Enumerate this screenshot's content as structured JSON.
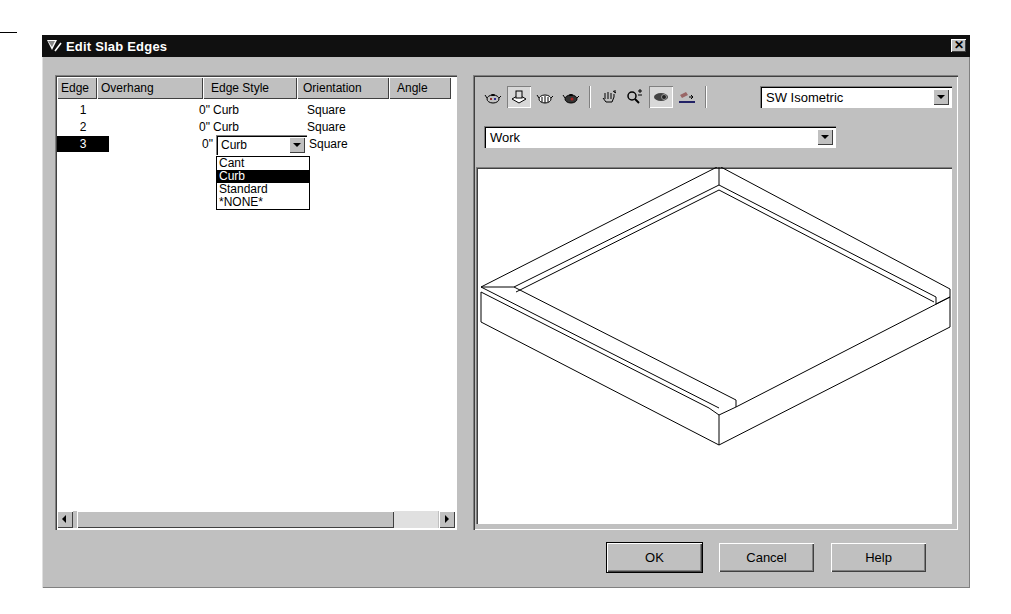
{
  "dialog": {
    "title": "Edit Slab Edges",
    "close_label": "✕"
  },
  "table": {
    "columns": [
      {
        "label": "Edge",
        "width": 40
      },
      {
        "label": "Overhang",
        "width": 106
      },
      {
        "label": "Edge Style",
        "width": 94
      },
      {
        "label": "Orientation",
        "width": 92
      },
      {
        "label": "Angle",
        "width": 62
      }
    ],
    "rows": [
      {
        "edge": "1",
        "overhang": "0\"",
        "edge_style": "Curb",
        "orientation": "Square",
        "angle": "",
        "selected": false
      },
      {
        "edge": "2",
        "overhang": "0\"",
        "edge_style": "Curb",
        "orientation": "Square",
        "angle": "",
        "selected": false
      },
      {
        "edge": "3",
        "overhang": "0\"",
        "edge_style": "Curb",
        "orientation": "Square",
        "angle": "",
        "selected": true
      }
    ],
    "edge_style_dropdown": {
      "value": "Curb",
      "options": [
        "Cant",
        "Curb",
        "Standard",
        "*NONE*"
      ],
      "highlighted": "Curb"
    }
  },
  "viewer": {
    "toolbar_icons": [
      {
        "name": "teapot-wireframe-icon",
        "pressed": false
      },
      {
        "name": "slab-object-icon",
        "pressed": true
      },
      {
        "name": "teapot-hidden-icon",
        "pressed": false
      },
      {
        "name": "teapot-shaded-icon",
        "pressed": false
      },
      {
        "name": "pan-hand-icon",
        "pressed": false
      },
      {
        "name": "zoom-icon",
        "pressed": false
      },
      {
        "name": "orbit-eye-icon",
        "pressed": true
      },
      {
        "name": "flat-shade-icon",
        "pressed": false
      }
    ],
    "view_combo": "SW Isometric",
    "layer_combo": "Work"
  },
  "buttons": {
    "ok": "OK",
    "cancel": "Cancel",
    "help": "Help"
  }
}
